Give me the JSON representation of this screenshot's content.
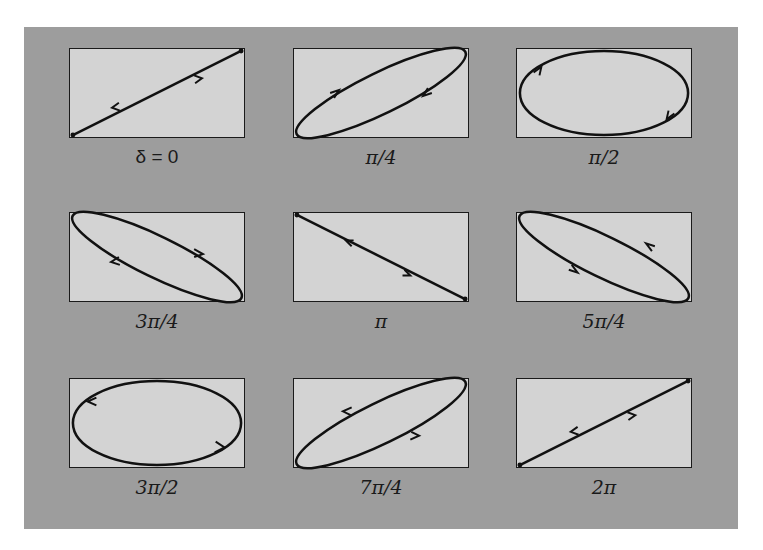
{
  "figure": {
    "title": "",
    "colors": {
      "panel_background": "#9d9d9d",
      "box_background": "#d3d3d3",
      "curve": "#111111"
    },
    "panels": [
      {
        "label": "δ = 0",
        "delta": "0",
        "shape": "line-ascending",
        "arrows": "bidirectional"
      },
      {
        "label": "π/4",
        "delta": "π/4",
        "shape": "ellipse-ascending",
        "direction": "clockwise"
      },
      {
        "label": "π/2",
        "delta": "π/2",
        "shape": "ellipse-axis-aligned",
        "direction": "clockwise"
      },
      {
        "label": "3π/4",
        "delta": "3π/4",
        "shape": "ellipse-descending",
        "direction": "clockwise"
      },
      {
        "label": "π",
        "delta": "π",
        "shape": "line-descending",
        "arrows": "bidirectional"
      },
      {
        "label": "5π/4",
        "delta": "5π/4",
        "shape": "ellipse-descending",
        "direction": "counterclockwise"
      },
      {
        "label": "3π/2",
        "delta": "3π/2",
        "shape": "ellipse-axis-aligned",
        "direction": "counterclockwise"
      },
      {
        "label": "7π/4",
        "delta": "7π/4",
        "shape": "ellipse-ascending",
        "direction": "counterclockwise"
      },
      {
        "label": "2π",
        "delta": "2π",
        "shape": "line-ascending",
        "arrows": "bidirectional"
      }
    ]
  }
}
